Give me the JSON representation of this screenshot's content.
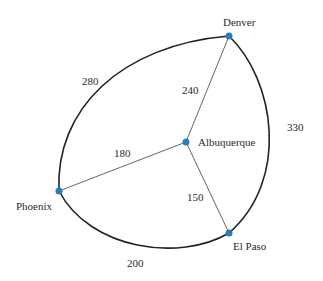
{
  "diagram": {
    "type": "weighted-graph",
    "node_color": "#2a7db8",
    "nodes": [
      {
        "id": "denver",
        "label": "Denver"
      },
      {
        "id": "albuquerque",
        "label": "Albuquerque"
      },
      {
        "id": "phoenix",
        "label": "Phoenix"
      },
      {
        "id": "elpaso",
        "label": "El Paso"
      }
    ],
    "edges": [
      {
        "from": "phoenix",
        "to": "denver",
        "weight": "280",
        "style": "curved"
      },
      {
        "from": "denver",
        "to": "elpaso",
        "weight": "330",
        "style": "curved"
      },
      {
        "from": "phoenix",
        "to": "elpaso",
        "weight": "200",
        "style": "curved"
      },
      {
        "from": "albuquerque",
        "to": "denver",
        "weight": "240",
        "style": "straight"
      },
      {
        "from": "albuquerque",
        "to": "phoenix",
        "weight": "180",
        "style": "straight"
      },
      {
        "from": "albuquerque",
        "to": "elpaso",
        "weight": "150",
        "style": "straight"
      }
    ]
  }
}
